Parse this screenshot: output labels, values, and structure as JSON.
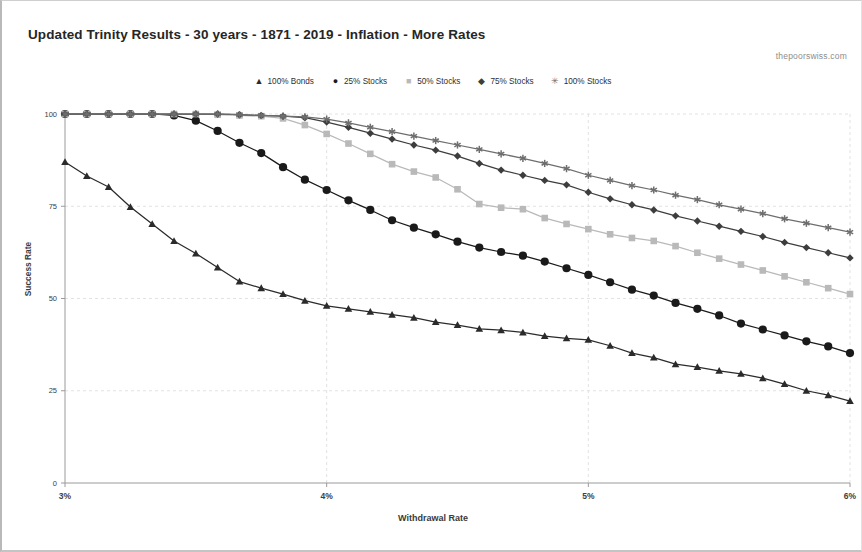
{
  "title": "Updated Trinity Results - 30 years - 1871 - 2019 - Inflation - More Rates",
  "watermark": "thepoorswiss.com",
  "axis": {
    "xlabel": "Withdrawal Rate",
    "ylabel": "Success Rate",
    "x_ticks": [
      "3%",
      "4%",
      "5%",
      "6%"
    ],
    "y_ticks": [
      "0",
      "25",
      "50",
      "75",
      "100"
    ]
  },
  "legend": [
    {
      "label": "100% Bonds",
      "marker": "triangle-marker",
      "glyph": "▲",
      "color": "#2b2b2b"
    },
    {
      "label": "25% Stocks",
      "marker": "circle-marker",
      "glyph": "●",
      "color": "#1a1a1a"
    },
    {
      "label": "50% Stocks",
      "marker": "square-marker",
      "glyph": "■",
      "color": "#b9b9b9"
    },
    {
      "label": "75% Stocks",
      "marker": "diamond-marker",
      "glyph": "◆",
      "color": "#3d3d3d"
    },
    {
      "label": "100% Stocks",
      "marker": "star-marker",
      "glyph": "✳",
      "color": "#6e6e6e"
    }
  ],
  "chart_data": {
    "type": "line",
    "title": "Updated Trinity Results - 30 years - 1871 - 2019 - Inflation - More Rates",
    "xlabel": "Withdrawal Rate",
    "ylabel": "Success Rate",
    "xlim": [
      3.0,
      6.0
    ],
    "ylim": [
      0,
      100
    ],
    "x_tick_values": [
      3.0,
      4.0,
      5.0,
      6.0
    ],
    "y_tick_values": [
      0,
      25,
      50,
      75,
      100
    ],
    "grid": true,
    "legend_position": "top-center",
    "x": [
      3.0,
      3.0833,
      3.1667,
      3.25,
      3.3333,
      3.4167,
      3.5,
      3.5833,
      3.6667,
      3.75,
      3.8333,
      3.9167,
      4.0,
      4.0833,
      4.1667,
      4.25,
      4.3333,
      4.4167,
      4.5,
      4.5833,
      4.6667,
      4.75,
      4.8333,
      4.9167,
      5.0,
      5.0833,
      5.1667,
      5.25,
      5.3333,
      5.4167,
      5.5,
      5.5833,
      5.6667,
      5.75,
      5.8333,
      5.9167,
      6.0
    ],
    "series": [
      {
        "name": "100% Bonds",
        "marker": "triangle",
        "color": "#2b2b2b",
        "values": [
          87.0,
          83.2,
          80.2,
          74.8,
          70.2,
          65.6,
          62.2,
          58.4,
          54.6,
          52.8,
          51.2,
          49.4,
          48.0,
          47.2,
          46.4,
          45.6,
          44.8,
          43.6,
          42.8,
          41.8,
          41.4,
          40.8,
          39.8,
          39.2,
          38.8,
          37.2,
          35.2,
          34.0,
          32.2,
          31.4,
          30.4,
          29.6,
          28.4,
          26.8,
          25.0,
          23.8,
          22.2
        ]
      },
      {
        "name": "25% Stocks",
        "marker": "circle",
        "color": "#1a1a1a",
        "values": [
          100.0,
          100.0,
          100.0,
          100.0,
          100.0,
          99.6,
          98.2,
          95.4,
          92.2,
          89.4,
          85.6,
          82.2,
          79.4,
          76.6,
          74.0,
          71.2,
          69.2,
          67.4,
          65.4,
          63.8,
          62.6,
          61.6,
          60.0,
          58.2,
          56.4,
          54.4,
          52.4,
          50.8,
          48.8,
          47.2,
          45.4,
          43.2,
          41.6,
          40.0,
          38.4,
          37.0,
          35.2
        ]
      },
      {
        "name": "50% Stocks",
        "marker": "square",
        "color": "#b9b9b9",
        "values": [
          100.0,
          100.0,
          100.0,
          100.0,
          100.0,
          100.0,
          100.0,
          99.8,
          99.6,
          99.4,
          98.8,
          97.0,
          94.6,
          92.0,
          89.2,
          86.4,
          84.4,
          82.8,
          79.6,
          75.6,
          74.6,
          74.2,
          71.8,
          70.2,
          68.8,
          67.4,
          66.4,
          65.6,
          64.2,
          62.4,
          60.8,
          59.2,
          57.6,
          56.0,
          54.4,
          52.8,
          51.2
        ]
      },
      {
        "name": "75% Stocks",
        "marker": "diamond",
        "color": "#3d3d3d",
        "values": [
          100.0,
          100.0,
          100.0,
          100.0,
          100.0,
          100.0,
          100.0,
          100.0,
          99.8,
          99.6,
          99.4,
          99.0,
          97.8,
          96.4,
          94.8,
          93.2,
          91.6,
          90.2,
          88.6,
          86.6,
          84.8,
          83.4,
          82.0,
          80.8,
          78.8,
          77.0,
          75.4,
          74.0,
          72.4,
          71.0,
          69.6,
          68.2,
          66.8,
          65.2,
          63.8,
          62.4,
          61.0
        ]
      },
      {
        "name": "100% Stocks",
        "marker": "star",
        "color": "#6e6e6e",
        "values": [
          100.0,
          100.0,
          100.0,
          100.0,
          100.0,
          100.0,
          100.0,
          100.0,
          99.8,
          99.6,
          99.4,
          99.2,
          98.6,
          97.6,
          96.4,
          95.2,
          94.0,
          92.8,
          91.6,
          90.4,
          89.2,
          88.0,
          86.6,
          85.2,
          83.4,
          82.0,
          80.6,
          79.4,
          78.0,
          76.8,
          75.4,
          74.2,
          73.0,
          71.6,
          70.4,
          69.2,
          68.0
        ]
      }
    ]
  }
}
